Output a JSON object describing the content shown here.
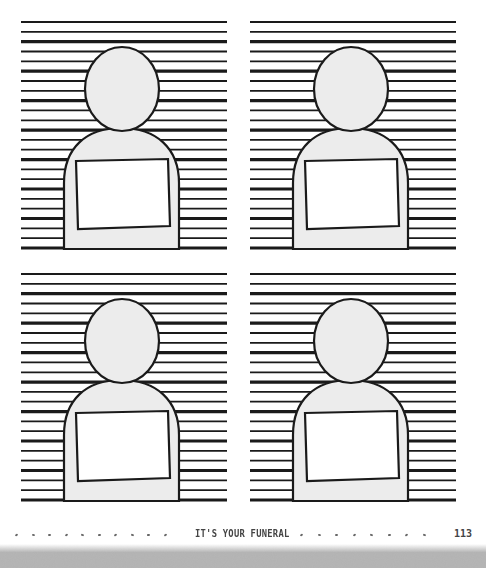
{
  "page": {
    "running_title": "IT'S YOUR FUNERAL",
    "page_number": "113"
  },
  "panels": [
    {
      "id": "mugshot-1",
      "label": "Mugshot template"
    },
    {
      "id": "mugshot-2",
      "label": "Mugshot template"
    },
    {
      "id": "mugshot-3",
      "label": "Mugshot template"
    },
    {
      "id": "mugshot-4",
      "label": "Mugshot template"
    }
  ],
  "colors": {
    "line": "#1a1a1a",
    "silhouette_fill": "#ececec",
    "sign_fill": "#ffffff",
    "footer_text": "#444444",
    "noise": "#8a8a8a"
  }
}
